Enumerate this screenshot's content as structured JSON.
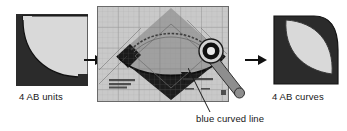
{
  "diagram": {
    "type": "quilting-instruction-diagram",
    "background_color": "#ffffff",
    "panels": [
      {
        "id": "left",
        "name": "4 AB units",
        "caption": "4 AB units",
        "description": "Square patchwork unit, dark fabric background with light quarter-circle arc",
        "colors": {
          "dark": "#2b2b2b",
          "light": "#d7d7d7",
          "outline": "#1a1a1a"
        }
      },
      {
        "id": "center",
        "name": "ruler-on-block",
        "caption": "",
        "description": "Transparent gridded quilting ruler placed over dark on-point square, rotary cutter at right",
        "colors": {
          "ruler": "#cfcfcf",
          "grid": "#7a7a7a",
          "dark": "#1c1c1c",
          "mid": "#9a9a9a",
          "blade": "#111111",
          "handle": "#8a8a8a"
        }
      },
      {
        "id": "right",
        "name": "4 AB curves",
        "caption": "4 AB curves",
        "description": "Quarter-circle unit, dark fabric with light lens/leaf shape",
        "colors": {
          "dark": "#2b2b2b",
          "light": "#d7d7d7",
          "outline": "#1a1a1a"
        }
      }
    ],
    "captions": {
      "left": "4 AB units",
      "right": "4 AB curves",
      "annotation": "blue curved line"
    },
    "arrows": [
      {
        "id": "arrow-1",
        "direction": "right",
        "from": "left",
        "to": "center"
      },
      {
        "id": "arrow-2",
        "direction": "right",
        "from": "center",
        "to": "right"
      }
    ],
    "annotation": {
      "label": "blue curved line",
      "leader": "diagonal line from label up-left to the curved cut edge on the block"
    }
  }
}
